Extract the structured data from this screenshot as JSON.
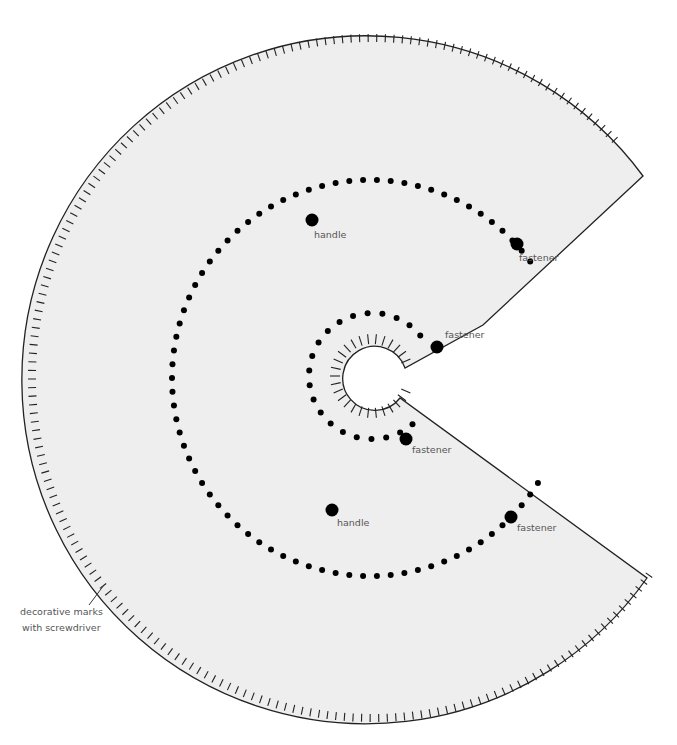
{
  "diagram": {
    "colors": {
      "fill": "#eeeeee",
      "stroke": "#222222",
      "dot": "#000000",
      "label": "#555555",
      "background": "#ffffff"
    },
    "outer": {
      "cx": 372,
      "cy": 378,
      "r": 344,
      "tick_count": 200,
      "tick_length": 8,
      "start_angle_deg": -41.5,
      "end_angle_deg": 33.5
    },
    "cut": {
      "upper": [
        [
          643,
          176
        ],
        [
          483,
          325
        ],
        [
          405,
          368
        ]
      ],
      "lower": [
        [
          400,
          398
        ],
        [
          647,
          578
        ]
      ]
    },
    "hole": {
      "cx": 372,
      "cy": 376,
      "r": 32,
      "tick_length": 10,
      "tick_step_deg": 12
    },
    "middle_dots": {
      "cx": 370,
      "cy": 378,
      "r": 198,
      "start_angle_deg": 120,
      "end_angle_deg": -34,
      "spacing_deg": 4.0,
      "dot_r": 3
    },
    "inner_dots": {
      "cx": 372,
      "cy": 376,
      "r": 63,
      "start_angle_deg": 90,
      "end_angle_deg": -45,
      "spacing_deg": 13.5,
      "dot_r": 3
    },
    "labels": [
      {
        "text": "handle",
        "x": 314,
        "y": 238,
        "dot": [
          312,
          220
        ],
        "dot_r": 6.5
      },
      {
        "text": "fastener",
        "x": 519,
        "y": 261,
        "dot": [
          517,
          244
        ],
        "dot_r": 6.5
      },
      {
        "text": "fastener",
        "x": 445,
        "y": 338,
        "dot": [
          437,
          347
        ],
        "dot_r": 6.5
      },
      {
        "text": "fastener",
        "x": 412,
        "y": 453,
        "dot": [
          406,
          439
        ],
        "dot_r": 6.5
      },
      {
        "text": "handle",
        "x": 337,
        "y": 526,
        "dot": [
          332,
          510
        ],
        "dot_r": 6.5
      },
      {
        "text": "fastener",
        "x": 517,
        "y": 531,
        "dot": [
          511,
          517
        ],
        "dot_r": 6.5
      }
    ],
    "annotation": {
      "lines": [
        "decorative marks",
        "with screwdriver"
      ],
      "x": 20,
      "y1": 615,
      "y2": 631,
      "leader": [
        [
          89,
          605
        ],
        [
          104,
          585
        ]
      ]
    }
  }
}
